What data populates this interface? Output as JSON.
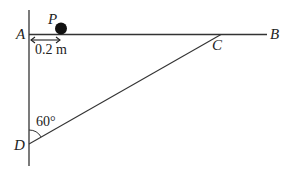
{
  "diagram": {
    "labels": {
      "A": "A",
      "B": "B",
      "C": "C",
      "D": "D",
      "P": "P"
    },
    "distance_label": "0.2 m",
    "angle_label": "60°",
    "colors": {
      "line": "#333333",
      "ball": "#111111",
      "background": "#ffffff"
    }
  }
}
